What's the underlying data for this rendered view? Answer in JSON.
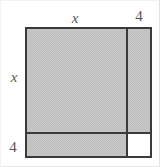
{
  "figure": {
    "kind": "geometry-diagram",
    "background_color": "#ffffff",
    "outline_color": "#3a3a3a",
    "shade_color": "#c9c9c9",
    "unshaded_color": "#ffffff",
    "label_color": "#555555",
    "labels": {
      "top_left_segment": "x",
      "top_right_segment": "4",
      "left_upper_segment": "x",
      "left_lower_segment": "4"
    },
    "regions": [
      {
        "name": "x-by-x",
        "width_label": "x",
        "height_label": "x",
        "shaded": true
      },
      {
        "name": "4-by-x",
        "width_label": "4",
        "height_label": "x",
        "shaded": true
      },
      {
        "name": "x-by-4",
        "width_label": "x",
        "height_label": "4",
        "shaded": true
      },
      {
        "name": "4-by-4",
        "width_label": "4",
        "height_label": "4",
        "shaded": false
      }
    ]
  }
}
